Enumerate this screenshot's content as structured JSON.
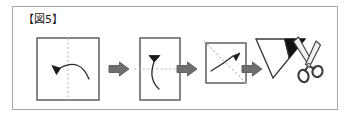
{
  "figure": {
    "label": "【図5】",
    "border_color": "#a8a8a8",
    "background": "#ffffff"
  },
  "colors": {
    "outline": "#4a4a4a",
    "shape_stroke": "#555555",
    "fold_line": "#bdbdbd",
    "arrow_fill": "#6e6e6e",
    "arrow_stroke": "#5a5a5a",
    "filled_corner": "#111111",
    "scissor_gray": "#8a8a8a"
  },
  "steps": [
    {
      "index": 1,
      "name": "square-vertical-fold",
      "shape": "square",
      "fold_line": "vertical-dashed-center",
      "motion": "curved-arrow-right-to-left",
      "arrowhead": "left",
      "description": "Square sheet folded in half along the vertical center line, right edge brought to the left."
    },
    {
      "index": 2,
      "name": "rectangle-horizontal-fold",
      "shape": "vertical-rectangle",
      "fold_line": "horizontal-dashed-center",
      "motion": "curved-arrow-bottom-to-top",
      "arrowhead": "up",
      "description": "Resulting tall rectangle folded in half along the horizontal center line, bottom edge brought up."
    },
    {
      "index": 3,
      "name": "square-diagonal-fold",
      "shape": "small-square",
      "fold_line": "diagonal-dashed",
      "motion": "curved-arrow-lower-left-to-upper-right",
      "arrowhead": "up-right",
      "description": "Resulting small square folded along the diagonal."
    },
    {
      "index": 4,
      "name": "triangle-cut-with-scissors",
      "shape": "triangle",
      "filled_region": "top-right-corner-black",
      "tool": "scissors",
      "description": "Folded triangle with a shaded corner being cut off with scissors."
    }
  ],
  "arrows": [
    {
      "index": 1,
      "name": "step-arrow-1",
      "direction": "right"
    },
    {
      "index": 2,
      "name": "step-arrow-2",
      "direction": "right"
    },
    {
      "index": 3,
      "name": "step-arrow-3",
      "direction": "right"
    }
  ]
}
